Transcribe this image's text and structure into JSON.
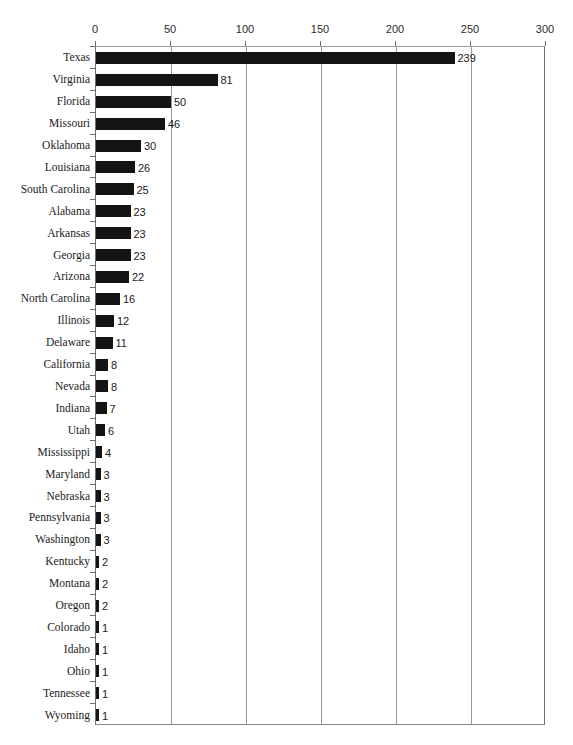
{
  "chart_data": {
    "type": "bar",
    "orientation": "horizontal",
    "title": "",
    "subtitle": "",
    "xlabel": "",
    "ylabel": "",
    "xlim": [
      0,
      300
    ],
    "ylim": null,
    "grid": true,
    "legend": null,
    "xticks": [
      0,
      50,
      100,
      150,
      200,
      250,
      300
    ],
    "xtick_labels": [
      "0",
      "50",
      "100",
      "150",
      "200",
      "250",
      "300"
    ],
    "categories": [
      "Texas",
      "Virginia",
      "Florida",
      "Missouri",
      "Oklahoma",
      "Louisiana",
      "South Carolina",
      "Alabama",
      "Arkansas",
      "Georgia",
      "Arizona",
      "North Carolina",
      "Illinois",
      "Delaware",
      "California",
      "Nevada",
      "Indiana",
      "Utah",
      "Mississippi",
      "Maryland",
      "Nebraska",
      "Pennsylvania",
      "Washington",
      "Kentucky",
      "Montana",
      "Oregon",
      "Colorado",
      "Idaho",
      "Ohio",
      "Tennessee",
      "Wyoming"
    ],
    "values": [
      239,
      81,
      50,
      46,
      30,
      26,
      25,
      23,
      23,
      23,
      22,
      16,
      12,
      11,
      8,
      8,
      7,
      6,
      4,
      3,
      3,
      3,
      3,
      2,
      2,
      2,
      1,
      1,
      1,
      1,
      1
    ],
    "data_labels": [
      "239",
      "81",
      "50",
      "46",
      "30",
      "26",
      "25",
      "23",
      "23",
      "23",
      "22",
      "16",
      "12",
      "11",
      "8",
      "8",
      "7",
      "6",
      "4",
      "3",
      "3",
      "3",
      "3",
      "2",
      "2",
      "2",
      "1",
      "1",
      "1",
      "1",
      "1"
    ],
    "colors": {
      "bar": "#141414",
      "gridline": "#9b9b9b",
      "axis": "#6e6e6e",
      "text": "#1a1a1a",
      "background": "#ffffff"
    }
  }
}
